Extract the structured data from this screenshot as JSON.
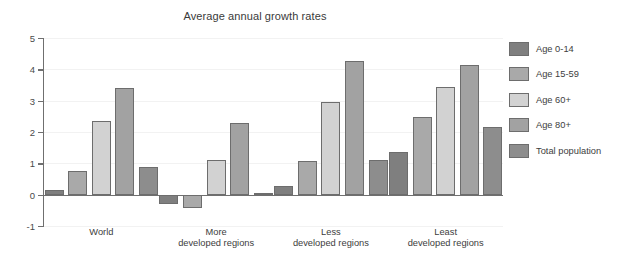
{
  "chart_data": {
    "type": "bar",
    "title": "Average annual growth rates",
    "xlabel": "",
    "ylabel": "percent",
    "ylim": [
      -1,
      5
    ],
    "yticks": [
      -1,
      0,
      1,
      2,
      3,
      4,
      5
    ],
    "ytick_labels": [
      "-1",
      "0",
      "1",
      "2",
      "3",
      "4",
      "5"
    ],
    "grid": true,
    "legend_position": "right",
    "categories": [
      "World",
      "More developed regions",
      "Less developed regions",
      "Least developed regions"
    ],
    "category_lines": [
      [
        "World",
        ""
      ],
      [
        "More",
        "developed regions"
      ],
      [
        "Less",
        "developed regions"
      ],
      [
        "Least",
        "developed regions"
      ]
    ],
    "series": [
      {
        "name": "Age 0-14",
        "color": "#7f7f7f",
        "values": [
          0.15,
          -0.3,
          0.27,
          1.36
        ]
      },
      {
        "name": "Age 15-59",
        "color": "#a9a9a9",
        "values": [
          0.75,
          -0.42,
          1.07,
          2.47
        ]
      },
      {
        "name": "Age 60+",
        "color": "#d2d2d2",
        "values": [
          2.35,
          1.1,
          2.95,
          3.45
        ]
      },
      {
        "name": "Age 80+",
        "color": "#a2a2a2",
        "values": [
          3.4,
          2.28,
          4.28,
          4.15
        ]
      },
      {
        "name": "Total population",
        "color": "#8d8d8d",
        "values": [
          0.88,
          0.04,
          1.12,
          2.16
        ]
      }
    ]
  },
  "legend": {
    "items": [
      {
        "label": "Age 0-14"
      },
      {
        "label": "Age 15-59"
      },
      {
        "label": "Age 60+"
      },
      {
        "label": "Age 80+"
      },
      {
        "label": "Total population"
      }
    ]
  }
}
